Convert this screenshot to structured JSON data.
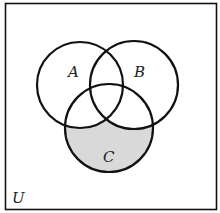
{
  "diagram": {
    "type": "venn",
    "universe_label": "U",
    "sets": [
      {
        "id": "A",
        "label": "A",
        "cx": 80,
        "cy": 85,
        "r": 43
      },
      {
        "id": "B",
        "label": "B",
        "cx": 134,
        "cy": 85,
        "r": 44
      },
      {
        "id": "C",
        "label": "C",
        "cx": 109,
        "cy": 128,
        "r": 44
      }
    ],
    "shaded_region": "C minus (A union B)",
    "colors": {
      "stroke": "#111111",
      "shade": "#d9d9d9",
      "background": "#ffffff"
    }
  }
}
